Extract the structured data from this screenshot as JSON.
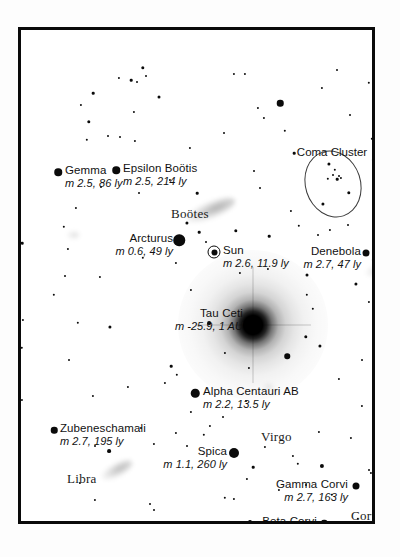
{
  "chart_data": {
    "type": "scatter",
    "xlabel": "",
    "ylabel": "",
    "frame": {
      "x": 18,
      "y": 27,
      "width": 357,
      "height": 497
    },
    "labeled_objects": [
      {
        "name": "Gemma",
        "mag_text": "m 2.5, 86 ly",
        "magnitude": 2.5,
        "distance": "86 ly",
        "x": 37,
        "y": 142,
        "size": 7.5,
        "label_x": 44,
        "label_y": 134,
        "align": "left"
      },
      {
        "name": "Epsilon Boötis",
        "mag_text": "m 2.5, 214 ly",
        "magnitude": 2.5,
        "distance": "214 ly",
        "x": 95,
        "y": 140,
        "size": 7.5,
        "label_x": 102,
        "label_y": 132,
        "align": "left"
      },
      {
        "name": "Arcturus",
        "mag_text": "m 0.6, 49 ly",
        "magnitude": 0.6,
        "distance": "49 ly",
        "x": 158,
        "y": 210,
        "size": 11.5,
        "label_x": 152,
        "label_y": 202,
        "align": "right"
      },
      {
        "name": "Sun",
        "mag_text": "m 2.6, 11.9 ly",
        "magnitude": 2.6,
        "distance": "11.9 ly",
        "x": 193,
        "y": 222,
        "size": 0,
        "label_x": 202,
        "label_y": 214,
        "align": "left",
        "marker": "sun"
      },
      {
        "name": "Denebola",
        "mag_text": "m 2.7, 47 ly",
        "magnitude": 2.7,
        "distance": "47 ly",
        "x": 345,
        "y": 223,
        "size": 7,
        "label_x": 340,
        "label_y": 215,
        "align": "right"
      },
      {
        "name": "Tau Ceti",
        "mag_text": "m -25.9, 1 AU",
        "magnitude": -25.9,
        "distance": "1 AU",
        "x": 232,
        "y": 295,
        "size": 0,
        "label_x": 222,
        "label_y": 277,
        "align": "right",
        "marker": "glow"
      },
      {
        "name": "Alpha Centauri AB",
        "mag_text": "m 2.2, 13.5 ly",
        "magnitude": 2.2,
        "distance": "13.5 ly",
        "x": 174,
        "y": 363,
        "size": 8.5,
        "label_x": 182,
        "label_y": 355,
        "align": "left"
      },
      {
        "name": "Zubeneschamali",
        "mag_text": "m 2.7, 195 ly",
        "magnitude": 2.7,
        "distance": "195 ly",
        "x": 33,
        "y": 400,
        "size": 6.5,
        "label_x": 39,
        "label_y": 392,
        "align": "left"
      },
      {
        "name": "Spica",
        "mag_text": "m 1.1, 260 ly",
        "magnitude": 1.1,
        "distance": "260 ly",
        "x": 213,
        "y": 423,
        "size": 10,
        "label_x": 206,
        "label_y": 415,
        "align": "right"
      },
      {
        "name": "Gamma Corvi",
        "mag_text": "m 2.7, 163 ly",
        "magnitude": 2.7,
        "distance": "163 ly",
        "x": 335,
        "y": 456,
        "size": 7,
        "label_x": 327,
        "label_y": 448,
        "align": "right"
      },
      {
        "name": "Beta Corvi",
        "mag_text": "m 2.8, 155 ly",
        "magnitude": 2.8,
        "distance": "155 ly",
        "x": 303,
        "y": 493,
        "size": 6.5,
        "label_x": 296,
        "label_y": 485,
        "align": "right"
      }
    ],
    "constellations": [
      {
        "name": "Boötes",
        "x": 150,
        "y": 176
      },
      {
        "name": "Virgo",
        "x": 240,
        "y": 399
      },
      {
        "name": "Libra",
        "x": 46,
        "y": 441
      },
      {
        "name": "Corvus",
        "x": 330,
        "y": 478
      }
    ],
    "clusters": [
      {
        "name": "Coma Cluster",
        "label_x": 311,
        "label_y": 116,
        "ellipse": {
          "cx": 312,
          "cy": 154,
          "rx": 27,
          "ry": 33
        },
        "members": [
          {
            "x": 308,
            "y": 134,
            "size": 3.2
          },
          {
            "x": 314,
            "y": 140,
            "size": 2.4
          },
          {
            "x": 312,
            "y": 145,
            "size": 2.0
          },
          {
            "x": 318,
            "y": 146,
            "size": 2.0
          },
          {
            "x": 307,
            "y": 149,
            "size": 2.4
          },
          {
            "x": 316,
            "y": 149,
            "size": 2.6
          },
          {
            "x": 320,
            "y": 148,
            "size": 2.2
          },
          {
            "x": 328,
            "y": 163,
            "size": 3.4
          },
          {
            "x": 302,
            "y": 174,
            "size": 3.2
          }
        ]
      }
    ],
    "smudges": [
      {
        "name": "bootes-galaxy",
        "x": 190,
        "y": 180,
        "w": 52,
        "h": 17,
        "rot": -22,
        "opacity": 0.3
      },
      {
        "name": "denebola-galaxy",
        "x": 372,
        "y": 236,
        "w": 56,
        "h": 16,
        "rot": -16,
        "opacity": 0.27
      },
      {
        "name": "libra-galaxy",
        "x": 96,
        "y": 440,
        "w": 34,
        "h": 14,
        "rot": -28,
        "opacity": 0.26
      },
      {
        "name": "faint-smudge-a",
        "x": 52,
        "y": 205,
        "w": 13,
        "h": 9,
        "rot": 0,
        "opacity": 0.12
      },
      {
        "name": "faint-smudge-b",
        "x": 247,
        "y": 357,
        "w": 11,
        "h": 8,
        "rot": 0,
        "opacity": 0.1
      }
    ],
    "field_stars": [
      {
        "x": 122,
        "y": 38,
        "size": 3.4
      },
      {
        "x": 125,
        "y": 46,
        "size": 2.0
      },
      {
        "x": 98,
        "y": 48,
        "size": 2.2
      },
      {
        "x": 110,
        "y": 50,
        "size": 2.6
      },
      {
        "x": 116,
        "y": 52,
        "size": 2.0
      },
      {
        "x": 213,
        "y": 44,
        "size": 2.2
      },
      {
        "x": 224,
        "y": 44,
        "size": 2.2
      },
      {
        "x": 316,
        "y": 40,
        "size": 2.0
      },
      {
        "x": 72,
        "y": 63,
        "size": 2.6
      },
      {
        "x": 138,
        "y": 67,
        "size": 3.0
      },
      {
        "x": 259,
        "y": 73,
        "size": 6.5
      },
      {
        "x": 301,
        "y": 58,
        "size": 2.2
      },
      {
        "x": 348,
        "y": 53,
        "size": 2.4
      },
      {
        "x": 355,
        "y": 64,
        "size": 2.4
      },
      {
        "x": 60,
        "y": 75,
        "size": 2.2
      },
      {
        "x": 113,
        "y": 82,
        "size": 2.2
      },
      {
        "x": 68,
        "y": 92,
        "size": 3.4
      },
      {
        "x": 237,
        "y": 78,
        "size": 2.2
      },
      {
        "x": 243,
        "y": 88,
        "size": 2.2
      },
      {
        "x": 329,
        "y": 85,
        "size": 2.0
      },
      {
        "x": 264,
        "y": 101,
        "size": 2.4
      },
      {
        "x": 203,
        "y": 103,
        "size": 2.0
      },
      {
        "x": 66,
        "y": 110,
        "size": 2.4
      },
      {
        "x": 87,
        "y": 106,
        "size": 2.0
      },
      {
        "x": 99,
        "y": 107,
        "size": 2.0
      },
      {
        "x": 114,
        "y": 111,
        "size": 2.2
      },
      {
        "x": 169,
        "y": 118,
        "size": 2.2
      },
      {
        "x": 351,
        "y": 109,
        "size": 2.4
      },
      {
        "x": 273,
        "y": 123,
        "size": 2.6
      },
      {
        "x": 352,
        "y": 130,
        "size": 2.2
      },
      {
        "x": 149,
        "y": 150,
        "size": 2.2
      },
      {
        "x": 233,
        "y": 141,
        "size": 2.0
      },
      {
        "x": 239,
        "y": 158,
        "size": 2.0
      },
      {
        "x": 80,
        "y": 157,
        "size": 2.0
      },
      {
        "x": 118,
        "y": 163,
        "size": 2.0
      },
      {
        "x": 176,
        "y": 163,
        "size": 2.6
      },
      {
        "x": 55,
        "y": 178,
        "size": 2.2
      },
      {
        "x": 270,
        "y": 181,
        "size": 2.2
      },
      {
        "x": 278,
        "y": 196,
        "size": 2.4
      },
      {
        "x": 166,
        "y": 193,
        "size": 3.2
      },
      {
        "x": 178,
        "y": 202,
        "size": 2.6
      },
      {
        "x": 185,
        "y": 212,
        "size": 2.0
      },
      {
        "x": 215,
        "y": 201,
        "size": 3.4
      },
      {
        "x": 248,
        "y": 206,
        "size": 2.6
      },
      {
        "x": 297,
        "y": 205,
        "size": 2.0
      },
      {
        "x": 309,
        "y": 200,
        "size": 2.2
      },
      {
        "x": 327,
        "y": 195,
        "size": 2.0
      },
      {
        "x": 1,
        "y": 213,
        "size": 2.6
      },
      {
        "x": 47,
        "y": 219,
        "size": 2.2
      },
      {
        "x": 122,
        "y": 228,
        "size": 2.4
      },
      {
        "x": 155,
        "y": 233,
        "size": 2.2
      },
      {
        "x": 219,
        "y": 243,
        "size": 2.2
      },
      {
        "x": 286,
        "y": 245,
        "size": 3.0
      },
      {
        "x": 247,
        "y": 239,
        "size": 2.2
      },
      {
        "x": 352,
        "y": 230,
        "size": 2.2
      },
      {
        "x": 335,
        "y": 254,
        "size": 3.2
      },
      {
        "x": 44,
        "y": 246,
        "size": 2.0
      },
      {
        "x": 79,
        "y": 247,
        "size": 2.2
      },
      {
        "x": 33,
        "y": 265,
        "size": 2.4
      },
      {
        "x": 170,
        "y": 260,
        "size": 2.2
      },
      {
        "x": 286,
        "y": 265,
        "size": 2.4
      },
      {
        "x": 348,
        "y": 272,
        "size": 2.2
      },
      {
        "x": 292,
        "y": 279,
        "size": 2.4
      },
      {
        "x": 2,
        "y": 290,
        "size": 2.2
      },
      {
        "x": 57,
        "y": 293,
        "size": 2.4
      },
      {
        "x": 89,
        "y": 297,
        "size": 3.2
      },
      {
        "x": 188,
        "y": 293,
        "size": 3.8
      },
      {
        "x": 285,
        "y": 307,
        "size": 3.4
      },
      {
        "x": 299,
        "y": 316,
        "size": 3.2
      },
      {
        "x": 266,
        "y": 326,
        "size": 5.5
      },
      {
        "x": 1,
        "y": 318,
        "size": 2.4
      },
      {
        "x": 48,
        "y": 330,
        "size": 2.0
      },
      {
        "x": 150,
        "y": 336,
        "size": 2.6
      },
      {
        "x": 156,
        "y": 345,
        "size": 2.4
      },
      {
        "x": 204,
        "y": 323,
        "size": 2.2
      },
      {
        "x": 341,
        "y": 330,
        "size": 2.0
      },
      {
        "x": 228,
        "y": 338,
        "size": 2.2
      },
      {
        "x": 318,
        "y": 349,
        "size": 2.2
      },
      {
        "x": 144,
        "y": 353,
        "size": 2.2
      },
      {
        "x": 107,
        "y": 357,
        "size": 2.2
      },
      {
        "x": 72,
        "y": 366,
        "size": 2.2
      },
      {
        "x": 1,
        "y": 370,
        "size": 2.2
      },
      {
        "x": 225,
        "y": 371,
        "size": 2.0
      },
      {
        "x": 341,
        "y": 376,
        "size": 2.2
      },
      {
        "x": 170,
        "y": 382,
        "size": 2.2
      },
      {
        "x": 202,
        "y": 387,
        "size": 2.0
      },
      {
        "x": 189,
        "y": 396,
        "size": 2.2
      },
      {
        "x": 155,
        "y": 403,
        "size": 2.2
      },
      {
        "x": 183,
        "y": 405,
        "size": 2.4
      },
      {
        "x": 120,
        "y": 398,
        "size": 2.0
      },
      {
        "x": 133,
        "y": 414,
        "size": 2.2
      },
      {
        "x": 166,
        "y": 416,
        "size": 2.0
      },
      {
        "x": 298,
        "y": 402,
        "size": 2.2
      },
      {
        "x": 330,
        "y": 408,
        "size": 2.2
      },
      {
        "x": 88,
        "y": 421,
        "size": 3.8
      },
      {
        "x": 74,
        "y": 416,
        "size": 2.0
      },
      {
        "x": 244,
        "y": 417,
        "size": 2.2
      },
      {
        "x": 272,
        "y": 426,
        "size": 2.2
      },
      {
        "x": 356,
        "y": 420,
        "size": 2.2
      },
      {
        "x": 232,
        "y": 437,
        "size": 2.6
      },
      {
        "x": 277,
        "y": 434,
        "size": 2.4
      },
      {
        "x": 301,
        "y": 436,
        "size": 4.2
      },
      {
        "x": 350,
        "y": 443,
        "size": 2.2
      },
      {
        "x": 226,
        "y": 449,
        "size": 2.2
      },
      {
        "x": 59,
        "y": 453,
        "size": 2.2
      },
      {
        "x": 74,
        "y": 470,
        "size": 2.2
      },
      {
        "x": 204,
        "y": 468,
        "size": 2.4
      },
      {
        "x": 213,
        "y": 469,
        "size": 2.2
      },
      {
        "x": 311,
        "y": 465,
        "size": 2.4
      },
      {
        "x": 355,
        "y": 472,
        "size": 2.4
      },
      {
        "x": 229,
        "y": 492,
        "size": 4.0
      },
      {
        "x": 337,
        "y": 489,
        "size": 2.4
      },
      {
        "x": 353,
        "y": 491,
        "size": 4.0
      },
      {
        "x": 129,
        "y": 474,
        "size": 2.0
      },
      {
        "x": 160,
        "y": 495,
        "size": 2.2
      },
      {
        "x": 103,
        "y": 500,
        "size": 2.2
      },
      {
        "x": 348,
        "y": 440,
        "size": 2.0
      },
      {
        "x": 133,
        "y": 480,
        "size": 2.0
      },
      {
        "x": 258,
        "y": 460,
        "size": 2.2
      },
      {
        "x": 285,
        "y": 455,
        "size": 2.0
      },
      {
        "x": 355,
        "y": 162,
        "size": 3.0
      },
      {
        "x": 43,
        "y": 197,
        "size": 2.4
      },
      {
        "x": 210,
        "y": 510,
        "size": 2.2
      },
      {
        "x": 173,
        "y": 509,
        "size": 5.0
      },
      {
        "x": 189,
        "y": 510,
        "size": 2.4
      }
    ]
  }
}
